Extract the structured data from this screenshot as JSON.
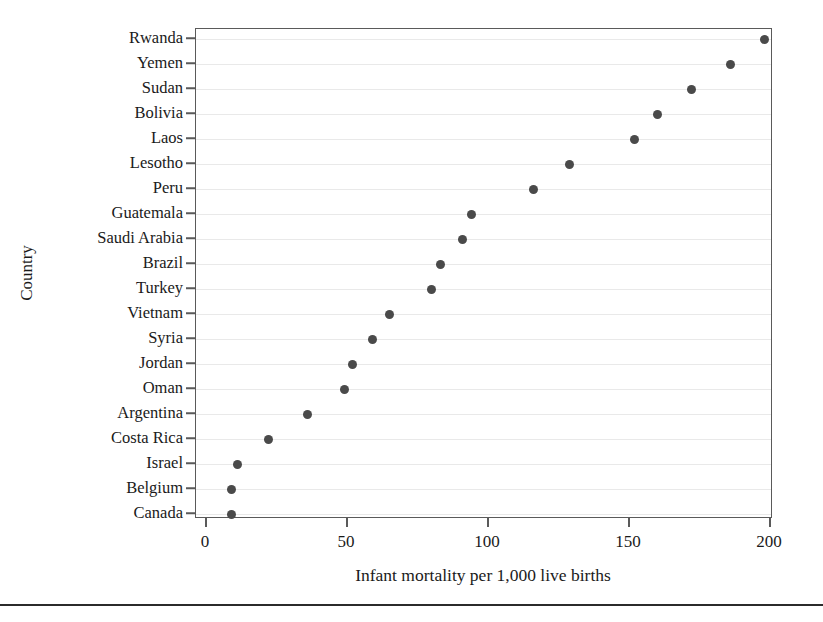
{
  "chart_data": {
    "type": "scatter",
    "title": "",
    "xlabel": "Infant mortality per 1,000 live births",
    "ylabel": "Country",
    "xlim": [
      0,
      205
    ],
    "xticks": [
      0,
      50,
      100,
      150,
      200
    ],
    "xtick_labels": [
      "0",
      "50",
      "100",
      "150",
      "200"
    ],
    "grid": "horizontal",
    "legend": "none",
    "marker": {
      "shape": "circle",
      "color": "#4a4a4a",
      "size_px": 9
    },
    "axis_color": "#5a5a5a",
    "gridline_color": "#e9e9e9",
    "categories": [
      "Rwanda",
      "Yemen",
      "Sudan",
      "Bolivia",
      "Laos",
      "Lesotho",
      "Peru",
      "Guatemala",
      "Saudi Arabia",
      "Brazil",
      "Turkey",
      "Vietnam",
      "Syria",
      "Jordan",
      "Oman",
      "Argentina",
      "Costa Rica",
      "Israel",
      "Belgium",
      "Canada"
    ],
    "values": [
      198,
      186,
      172,
      160,
      152,
      129,
      116,
      94,
      91,
      83,
      80,
      65,
      59,
      52,
      49,
      36,
      22,
      11,
      9,
      9
    ],
    "points": [
      {
        "country": "Rwanda",
        "infant_mortality": 198
      },
      {
        "country": "Yemen",
        "infant_mortality": 186
      },
      {
        "country": "Sudan",
        "infant_mortality": 172
      },
      {
        "country": "Bolivia",
        "infant_mortality": 160
      },
      {
        "country": "Laos",
        "infant_mortality": 152
      },
      {
        "country": "Lesotho",
        "infant_mortality": 129
      },
      {
        "country": "Peru",
        "infant_mortality": 116
      },
      {
        "country": "Guatemala",
        "infant_mortality": 94
      },
      {
        "country": "Saudi Arabia",
        "infant_mortality": 91
      },
      {
        "country": "Brazil",
        "infant_mortality": 83
      },
      {
        "country": "Turkey",
        "infant_mortality": 80
      },
      {
        "country": "Vietnam",
        "infant_mortality": 65
      },
      {
        "country": "Syria",
        "infant_mortality": 59
      },
      {
        "country": "Jordan",
        "infant_mortality": 52
      },
      {
        "country": "Oman",
        "infant_mortality": 49
      },
      {
        "country": "Argentina",
        "infant_mortality": 36
      },
      {
        "country": "Costa Rica",
        "infant_mortality": 22
      },
      {
        "country": "Israel",
        "infant_mortality": 11
      },
      {
        "country": "Belgium",
        "infant_mortality": 9
      },
      {
        "country": "Canada",
        "infant_mortality": 9
      }
    ]
  }
}
